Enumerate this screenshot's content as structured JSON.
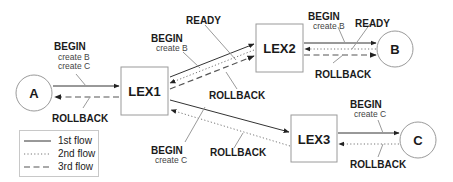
{
  "diagram": {
    "nodes": {
      "a": {
        "label": "A"
      },
      "b": {
        "label": "B"
      },
      "c": {
        "label": "C"
      },
      "lex1": {
        "label": "LEX1"
      },
      "lex2": {
        "label": "LEX2"
      },
      "lex3": {
        "label": "LEX3"
      }
    },
    "messages": {
      "a_lex1_begin": {
        "title": "BEGIN",
        "lines": [
          "create B",
          "create C"
        ]
      },
      "a_lex1_rollback": {
        "title": "ROLLBACK"
      },
      "lex1_lex2_begin": {
        "title": "BEGIN",
        "lines": [
          "create B"
        ]
      },
      "lex1_lex2_ready": {
        "title": "READY"
      },
      "lex1_lex2_rollback": {
        "title": "ROLLBACK"
      },
      "lex2_b_begin": {
        "title": "BEGIN",
        "lines": [
          "create B"
        ]
      },
      "lex2_b_ready": {
        "title": "READY"
      },
      "lex2_b_rollback": {
        "title": "ROLLBACK"
      },
      "lex1_lex3_begin": {
        "title": "BEGIN",
        "lines": [
          "create C"
        ]
      },
      "lex1_lex3_rollback": {
        "title": "ROLLBACK"
      },
      "lex3_c_begin": {
        "title": "BEGIN",
        "lines": [
          "create C"
        ]
      },
      "lex3_c_rollback": {
        "title": "ROLLBACK"
      }
    },
    "legend": [
      {
        "style": "solid",
        "label": "1st flow"
      },
      {
        "style": "dotted",
        "label": "2nd flow"
      },
      {
        "style": "dashed",
        "label": "3rd flow"
      }
    ]
  }
}
